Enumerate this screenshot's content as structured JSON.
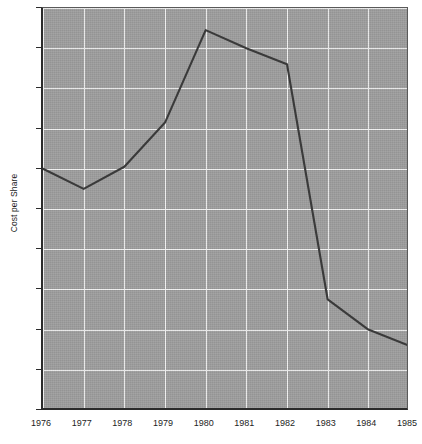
{
  "chart_data": {
    "type": "line",
    "title": "",
    "subtitle": "",
    "xlabel": "",
    "ylabel": "Cost per Share",
    "ylim": [
      5,
      15
    ],
    "xlim": [
      1976,
      1985
    ],
    "grid": true,
    "legend": false,
    "y_tick_labels": [
      "$15",
      "14",
      "13",
      "12",
      "11",
      "10",
      "9",
      "8",
      "7",
      "6",
      "5"
    ],
    "y_tick_values": [
      15,
      14,
      13,
      12,
      11,
      10,
      9,
      8,
      7,
      6,
      5
    ],
    "x_tick_labels": [
      "1976",
      "1977",
      "1978",
      "1979",
      "1980",
      "1981",
      "1982",
      "1983",
      "1984",
      "1985"
    ],
    "categories": [
      1976,
      1977,
      1978,
      1979,
      1980,
      1981,
      1982,
      1983,
      1984,
      1985
    ],
    "values": [
      11.0,
      10.5,
      11.05,
      12.15,
      14.45,
      14.0,
      13.6,
      7.75,
      7.0,
      6.6
    ],
    "series": [
      {
        "name": "Cost per Share",
        "color": "#3a3a3a",
        "values": [
          11.0,
          10.5,
          11.05,
          12.15,
          14.45,
          14.0,
          13.6,
          7.75,
          7.0,
          6.6
        ]
      }
    ]
  },
  "style": {
    "plot_background": "#9e9e9e",
    "grid_color": "#f2f2f2",
    "axis_color": "#2b2b2b",
    "line_color": "#3a3a3a",
    "page_background": "#ffffff"
  }
}
